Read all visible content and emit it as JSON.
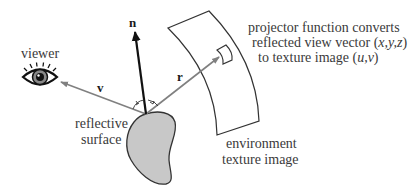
{
  "diagram": {
    "labels": {
      "viewer": "viewer",
      "normal_vector": "n",
      "view_vector": "v",
      "reflected_vector": "r",
      "surface_line1": "reflective",
      "surface_line2": "surface",
      "texture_line1": "environment",
      "texture_line2": "texture image",
      "projector_line1": "projector function converts",
      "projector_line2_prefix": "reflected view vector (",
      "projector_line2_vars": "x,y,z",
      "projector_line2_suffix": ")",
      "projector_line3_prefix": "to texture image (",
      "projector_line3_vars": "u,v",
      "projector_line3_suffix": ")"
    },
    "icons": {
      "viewer": "eye-icon",
      "surface": "blob-shape",
      "texture": "curved-sheet-shape"
    },
    "colors": {
      "vector_gray": "#808080",
      "normal_black": "#111111",
      "surface_fill": "#c8c8c8",
      "outline": "#333333",
      "text": "#3a3a3a"
    }
  }
}
